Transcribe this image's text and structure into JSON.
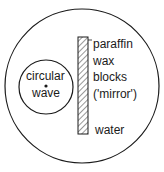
{
  "diagram": {
    "inner_circle": {
      "line1": "circular",
      "line2": "wave"
    },
    "strip_labels": [
      "paraffin",
      "wax",
      "blocks",
      "('mirror')"
    ],
    "water_label": "water",
    "colors": {
      "stroke": "#1a1a1a",
      "background": "#ffffff"
    }
  }
}
